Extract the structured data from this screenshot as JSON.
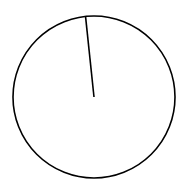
{
  "chart_data": {
    "type": "pie",
    "title": "",
    "categories": [
      ""
    ],
    "values": [
      100
    ],
    "colors": [
      "#ffffff"
    ],
    "edgecolor": "#000000",
    "legend": [],
    "labels_visible": false,
    "start_angle_deg_from_top_clockwise": 354
  },
  "style": {
    "background": "#ffffff",
    "stroke": "#000000",
    "center": [
      94,
      97
    ],
    "radius": 81
  }
}
